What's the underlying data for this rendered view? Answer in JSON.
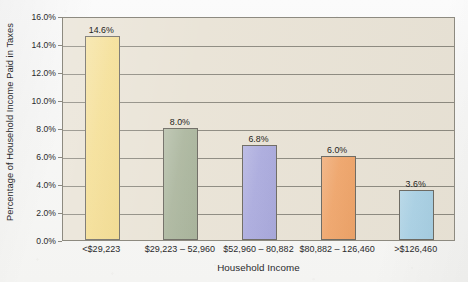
{
  "chart_data": {
    "type": "bar",
    "title": "",
    "xlabel": "Household Income",
    "ylabel": "Percentage of Household Income Paid in Taxes",
    "categories": [
      "<$29,223",
      "$29,223 – 52,960",
      "$52,960 – 80,882",
      "$80,882 – 126,460",
      ">$126,460"
    ],
    "values": [
      14.6,
      8.0,
      6.8,
      6.0,
      3.6
    ],
    "value_labels": [
      "14.6%",
      "8.0%",
      "6.8%",
      "6.0%",
      "3.6%"
    ],
    "bar_colors": [
      "#f4dc8c",
      "#a9b49b",
      "#a9a9dd",
      "#f0a468",
      "#a9d1e5"
    ],
    "bar_border_color": "#6e6b63",
    "ylim": [
      0.0,
      16.0
    ],
    "ytick_values": [
      0.0,
      2.0,
      4.0,
      6.0,
      8.0,
      10.0,
      12.0,
      14.0,
      16.0
    ],
    "ytick_labels": [
      "0.0%",
      "2.0%",
      "4.0%",
      "6.0%",
      "8.0%",
      "10.0%",
      "12.0%",
      "14.0%",
      "16.0%"
    ],
    "grid": true,
    "grid_axis": "y",
    "legend": "none",
    "plot_background": "#e9e3d6",
    "axis_color": "#8d8a80",
    "page_background": "#f7f7f6"
  }
}
